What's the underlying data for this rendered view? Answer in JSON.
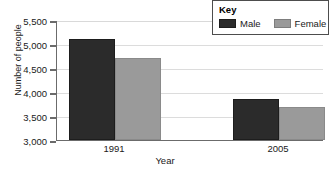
{
  "chart_data": {
    "type": "bar",
    "title": "",
    "xlabel": "Year",
    "ylabel": "Number of people",
    "categories": [
      "1991",
      "2005"
    ],
    "series": [
      {
        "name": "Male",
        "values": [
          5100,
          3860
        ],
        "color": "#2b2b2b"
      },
      {
        "name": "Female",
        "values": [
          4700,
          3680
        ],
        "color": "#9a9a9a"
      }
    ],
    "ylim": [
      3000,
      5500
    ],
    "ytick_labels": [
      "5,500",
      "5,000",
      "4,500",
      "4,000",
      "3,500",
      "3,000"
    ],
    "ytick_values": [
      5500,
      5000,
      4500,
      4000,
      3500,
      3000
    ],
    "grid": true,
    "legend_position": "top-right"
  },
  "legend": {
    "title": "Key",
    "entries": [
      {
        "label": "Male",
        "swatch": "male-swatch"
      },
      {
        "label": "Female",
        "swatch": "female-swatch"
      }
    ]
  },
  "axes": {
    "y_title": "Number of people",
    "x_title": "Year",
    "y_labels": {
      "t0": "5,500",
      "t1": "5,000",
      "t2": "4,500",
      "t3": "4,000",
      "t4": "3,500",
      "t5": "3,000"
    },
    "x_labels": {
      "g0": "1991",
      "g1": "2005"
    }
  }
}
